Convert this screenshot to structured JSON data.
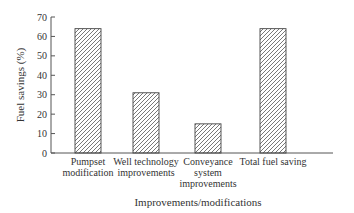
{
  "chart_data": {
    "type": "bar",
    "title": "",
    "xlabel": "Improvements/modifications",
    "ylabel": "Fuel savings (%)",
    "categories": [
      [
        "Pumpset",
        "modification"
      ],
      [
        "Well technology",
        "improvements"
      ],
      [
        "Conveyance",
        "system",
        "improvements"
      ],
      [
        "Total fuel saving"
      ]
    ],
    "values": [
      64,
      31,
      15,
      64
    ],
    "ylim": [
      0,
      70
    ],
    "yticks": [
      0,
      10,
      20,
      30,
      40,
      50,
      60,
      70
    ],
    "grid": false,
    "legend": null,
    "bar_fill": "diagonal-hatch"
  },
  "colors": {
    "axis": "#555555",
    "bar_stroke": "#444444",
    "hatch": "#555555"
  }
}
